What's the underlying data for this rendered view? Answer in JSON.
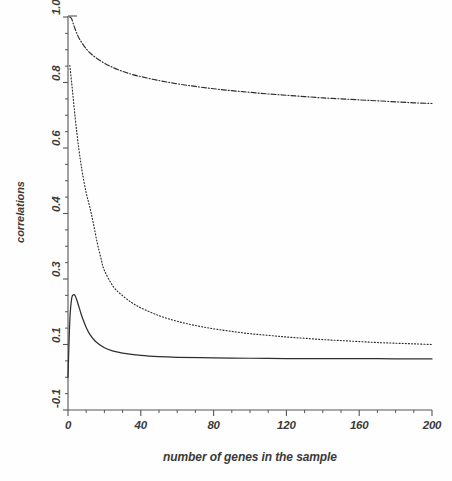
{
  "chart_data": {
    "type": "line",
    "title": "",
    "xlabel": "number of genes in the sample",
    "ylabel": "correlations",
    "xlim": [
      0,
      200
    ],
    "ylim": [
      -0.1,
      1.0
    ],
    "grid": false,
    "legend": "none",
    "x_ticks": [
      {
        "value": 0,
        "label": "0"
      },
      {
        "value": 40,
        "label": "40"
      },
      {
        "value": 80,
        "label": "80"
      },
      {
        "value": 120,
        "label": "120"
      },
      {
        "value": 160,
        "label": "160"
      },
      {
        "value": 200,
        "label": "200"
      }
    ],
    "x_minor_tick_step": 10,
    "y_ticks": [
      {
        "label": "1.0",
        "pos": 0
      },
      {
        "label": "0.8",
        "pos": 1
      },
      {
        "label": "0.6",
        "pos": 2
      },
      {
        "label": "0.4",
        "pos": 3
      },
      {
        "label": "0.3",
        "pos": 4
      },
      {
        "label": "0.1",
        "pos": 5
      },
      {
        "label": "-0.1",
        "pos": 6
      }
    ],
    "y_minor_ticks_between": 3,
    "series": [
      {
        "name": "upper curve",
        "style": "dash-dot",
        "color": "#2e2e2e",
        "x": [
          1,
          2,
          3,
          4,
          5,
          6,
          8,
          10,
          12,
          15,
          20,
          25,
          30,
          35,
          40,
          50,
          60,
          70,
          80,
          90,
          100,
          110,
          120,
          130,
          140,
          150,
          160,
          170,
          180,
          190,
          200
        ],
        "y": [
          1.0,
          0.995,
          0.978,
          0.962,
          0.948,
          0.936,
          0.918,
          0.903,
          0.891,
          0.877,
          0.859,
          0.845,
          0.834,
          0.825,
          0.818,
          0.806,
          0.796,
          0.788,
          0.781,
          0.775,
          0.77,
          0.765,
          0.761,
          0.757,
          0.753,
          0.75,
          0.747,
          0.744,
          0.741,
          0.738,
          0.736
        ]
      },
      {
        "name": "middle curve",
        "style": "dotted",
        "color": "#2e2e2e",
        "x": [
          1,
          2,
          3,
          4,
          5,
          6,
          7,
          8,
          10,
          12,
          14,
          16,
          18,
          20,
          25,
          30,
          35,
          40,
          50,
          60,
          70,
          80,
          90,
          100,
          110,
          120,
          130,
          140,
          150,
          160,
          170,
          180,
          190,
          200
        ],
        "y": [
          0.852,
          0.8,
          0.745,
          0.69,
          0.64,
          0.595,
          0.556,
          0.521,
          0.463,
          0.419,
          0.384,
          0.356,
          0.333,
          0.313,
          0.276,
          0.249,
          0.228,
          0.212,
          0.188,
          0.171,
          0.158,
          0.148,
          0.14,
          0.133,
          0.128,
          0.123,
          0.119,
          0.115,
          0.112,
          0.109,
          0.106,
          0.104,
          0.102,
          0.1
        ]
      },
      {
        "name": "lower curve",
        "style": "solid",
        "color": "#2e2e2e",
        "x": [
          0,
          1,
          2,
          3,
          4,
          5,
          6,
          7,
          8,
          10,
          12,
          15,
          20,
          25,
          30,
          40,
          50,
          60,
          80,
          100,
          120,
          140,
          160,
          180,
          200
        ],
        "y": [
          0.0,
          0.175,
          0.24,
          0.252,
          0.248,
          0.233,
          0.215,
          0.197,
          0.18,
          0.152,
          0.131,
          0.11,
          0.09,
          0.08,
          0.074,
          0.067,
          0.063,
          0.061,
          0.059,
          0.058,
          0.057,
          0.057,
          0.057,
          0.056,
          0.056
        ]
      }
    ]
  }
}
